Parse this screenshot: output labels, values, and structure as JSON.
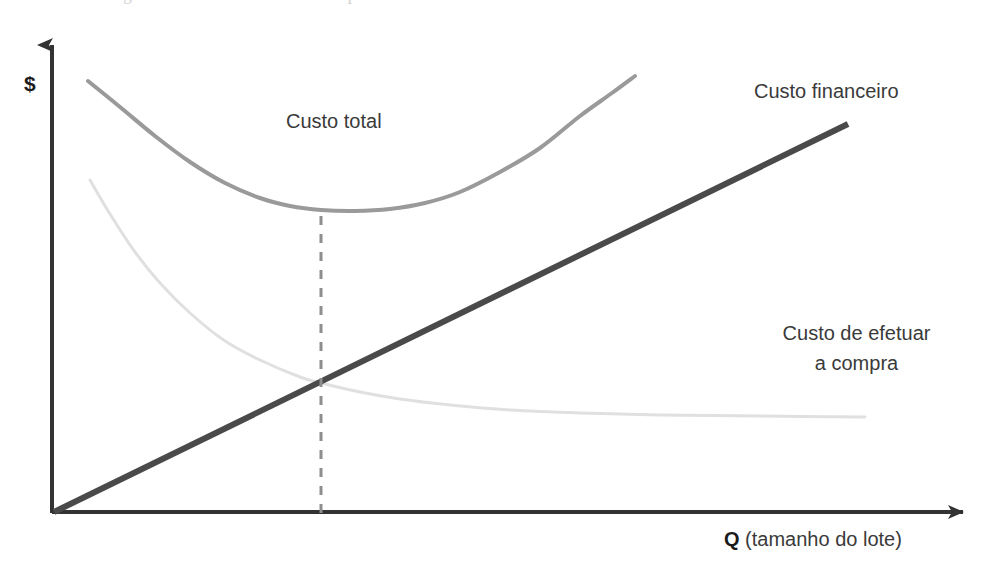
{
  "figure": {
    "caption_fragment": "Figura 4.4  Custo mínimo de compra",
    "width": 998,
    "height": 582
  },
  "chart_data": {
    "type": "line",
    "title": "",
    "subtitle": "",
    "xlabel": "Q (tamanho do lote)",
    "xlabel_bold_prefix": "Q",
    "xlabel_rest": " (tamanho do lote)",
    "ylabel": "$",
    "grid": false,
    "legend_position": "inline-annotations",
    "axes": {
      "x_axis_from": [
        52,
        513
      ],
      "x_axis_to": [
        975,
        512
      ],
      "y_axis_from": [
        52,
        513
      ],
      "y_axis_to": [
        52,
        37
      ],
      "arrowheads": true,
      "tick_labels_x": [],
      "tick_labels_y": []
    },
    "series": [
      {
        "name": "Custo total",
        "label": "Custo total",
        "role": "total-cost",
        "shape": "u-curve-convex",
        "color": "#9a9a9a",
        "stroke_width": 4,
        "points": [
          [
            88,
            81
          ],
          [
            120,
            107
          ],
          [
            155,
            136
          ],
          [
            190,
            162
          ],
          [
            225,
            183
          ],
          [
            260,
            198
          ],
          [
            290,
            206
          ],
          [
            321,
            210
          ],
          [
            355,
            211
          ],
          [
            390,
            209
          ],
          [
            425,
            203
          ],
          [
            460,
            192
          ],
          [
            500,
            172
          ],
          [
            540,
            148
          ],
          [
            580,
            116
          ],
          [
            612,
            93
          ],
          [
            635,
            76
          ]
        ],
        "minimum_at": [
          321,
          210
        ]
      },
      {
        "name": "Custo financeiro",
        "label": "Custo financeiro",
        "role": "holding-cost-linear",
        "shape": "straight-line",
        "color": "#4a4a4a",
        "stroke_width": 6,
        "points": [
          [
            54,
            512
          ],
          [
            848,
            124
          ]
        ]
      },
      {
        "name": "Custo de efetuar a compra",
        "label_line1": "Custo de efetuar",
        "label_line2": "a compra",
        "role": "ordering-cost-hyperbola",
        "shape": "decreasing-hyperbola",
        "color": "#e0e0e0",
        "stroke_width": 3,
        "points": [
          [
            90,
            180
          ],
          [
            110,
            214
          ],
          [
            135,
            252
          ],
          [
            160,
            283
          ],
          [
            190,
            313
          ],
          [
            225,
            341
          ],
          [
            260,
            360
          ],
          [
            300,
            377
          ],
          [
            321,
            383
          ],
          [
            360,
            392
          ],
          [
            400,
            399
          ],
          [
            450,
            405
          ],
          [
            510,
            410
          ],
          [
            580,
            413
          ],
          [
            660,
            415
          ],
          [
            760,
            416
          ],
          [
            865,
            417
          ]
        ]
      }
    ],
    "annotations": [
      {
        "name": "optimal-lot-dashed-line",
        "type": "vertical-dashed",
        "x": 321,
        "y_top": 216,
        "y_bottom": 513,
        "color": "#8e8e8e",
        "dash": "9 9",
        "stroke_width": 3
      },
      {
        "name": "total-cost-label",
        "text": "Custo total",
        "x": 286,
        "y": 110
      },
      {
        "name": "financial-cost-label",
        "text": "Custo financeiro",
        "x": 754,
        "y": 80
      },
      {
        "name": "ordering-cost-label",
        "text": "Custo de efetuar a compra",
        "x": 749,
        "y": 318
      }
    ],
    "colors": {
      "total_cost": "#9a9a9a",
      "financial_cost": "#4a4a4a",
      "ordering_cost": "#e0e0e0",
      "axis": "#333333",
      "dashed_guide": "#8e8e8e",
      "background": "#ffffff",
      "text": "#3a3a3a"
    }
  },
  "labels": {
    "y_axis": "$",
    "x_axis_bold": "Q",
    "x_axis_rest": " (tamanho do lote)",
    "total_cost": "Custo total",
    "financial_cost": "Custo financeiro",
    "ordering_cost_line1": "Custo de efetuar",
    "ordering_cost_line2": "a compra"
  }
}
